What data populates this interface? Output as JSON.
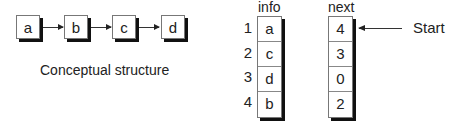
{
  "conceptual": {
    "nodes": [
      "a",
      "b",
      "c",
      "d"
    ],
    "caption": "Conceptual structure"
  },
  "table": {
    "info_header": "info",
    "next_header": "next",
    "indices": [
      "1",
      "2",
      "3",
      "4"
    ],
    "info": [
      "a",
      "c",
      "d",
      "b"
    ],
    "next": [
      "4",
      "3",
      "0",
      "2"
    ],
    "start_label": "Start"
  }
}
